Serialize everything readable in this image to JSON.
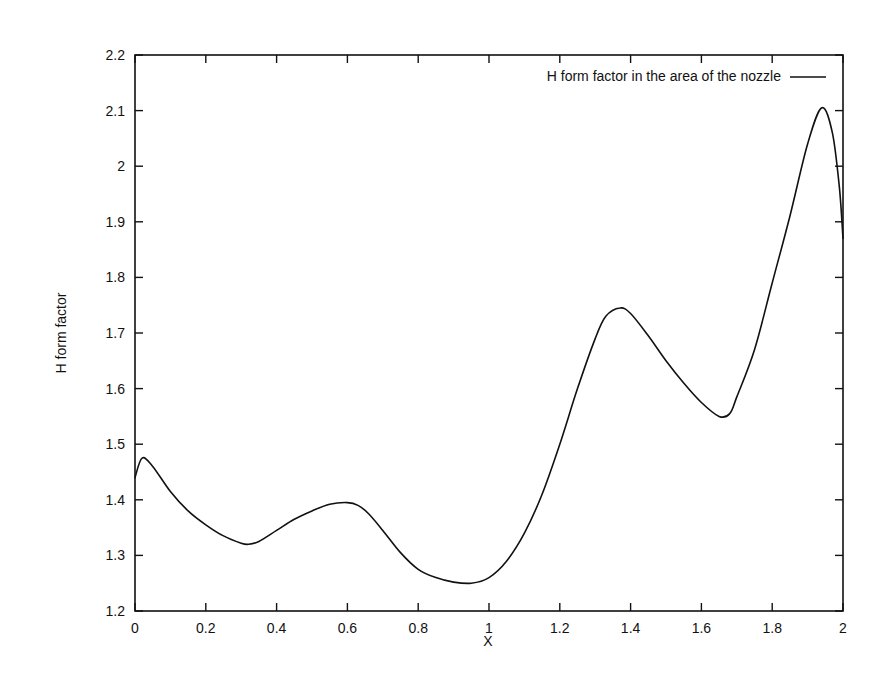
{
  "chart_data": {
    "type": "line",
    "title": "",
    "xlabel": "X",
    "ylabel": "H form factor",
    "xlim": [
      0,
      2
    ],
    "ylim": [
      1.2,
      2.2
    ],
    "grid": false,
    "legend_position": "top-right-inside",
    "x_ticks": [
      "0",
      "0.2",
      "0.4",
      "0.6",
      "0.8",
      "1",
      "1.2",
      "1.4",
      "1.6",
      "1.8",
      "2"
    ],
    "y_ticks": [
      "1.2",
      "1.3",
      "1.4",
      "1.5",
      "1.6",
      "1.7",
      "1.8",
      "1.9",
      "2",
      "2.1",
      "2.2"
    ],
    "series": [
      {
        "name": "H form factor in the area of the nozzle",
        "color": "#111111",
        "x": [
          0.0,
          0.02,
          0.05,
          0.1,
          0.15,
          0.2,
          0.25,
          0.3,
          0.32,
          0.35,
          0.4,
          0.45,
          0.5,
          0.55,
          0.6,
          0.63,
          0.66,
          0.7,
          0.75,
          0.8,
          0.85,
          0.9,
          0.95,
          1.0,
          1.05,
          1.1,
          1.15,
          1.2,
          1.25,
          1.3,
          1.33,
          1.37,
          1.4,
          1.45,
          1.5,
          1.55,
          1.6,
          1.65,
          1.68,
          1.7,
          1.75,
          1.8,
          1.85,
          1.9,
          1.94,
          1.97,
          1.99,
          2.0
        ],
        "y": [
          1.44,
          1.475,
          1.46,
          1.415,
          1.38,
          1.355,
          1.335,
          1.322,
          1.32,
          1.325,
          1.345,
          1.365,
          1.38,
          1.392,
          1.395,
          1.39,
          1.375,
          1.345,
          1.305,
          1.275,
          1.26,
          1.252,
          1.25,
          1.26,
          1.29,
          1.34,
          1.41,
          1.5,
          1.6,
          1.69,
          1.73,
          1.745,
          1.735,
          1.695,
          1.65,
          1.61,
          1.575,
          1.55,
          1.555,
          1.585,
          1.67,
          1.79,
          1.91,
          2.04,
          2.105,
          2.06,
          1.96,
          1.87
        ]
      }
    ]
  },
  "legend": {
    "label": "H form factor in the area of the nozzle"
  },
  "axes": {
    "xlabel": "X",
    "ylabel": "H form factor"
  }
}
